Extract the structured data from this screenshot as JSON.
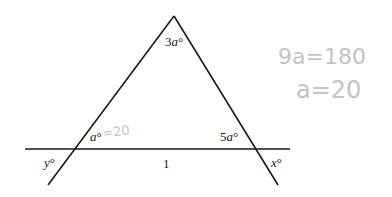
{
  "figure": {
    "type": "geometry-diagram",
    "stroke_color": "#1a1a1a",
    "handwriting_color": "#c4c4c4",
    "lines": {
      "horizontal": {
        "x1": 25,
        "y1": 149,
        "x2": 290,
        "y2": 149
      },
      "left": {
        "x1": 174,
        "y1": 16,
        "x2": 48,
        "y2": 185
      },
      "right": {
        "x1": 174,
        "y1": 16,
        "x2": 278,
        "y2": 185
      }
    },
    "labels": {
      "apex_angle": {
        "coef": "3",
        "var": "a",
        "deg": "°"
      },
      "left_base_angle": {
        "var": "a",
        "deg": "°"
      },
      "right_base_angle": {
        "coef": "5",
        "var": "a",
        "deg": "°"
      },
      "left_exterior": {
        "var": "y",
        "deg": "°"
      },
      "right_exterior": {
        "var": "x",
        "deg": "°"
      },
      "base_length": "1"
    },
    "handwritten": {
      "left_angle_note": "=20",
      "equation_1": "9a=180",
      "equation_2": "a=20"
    }
  }
}
